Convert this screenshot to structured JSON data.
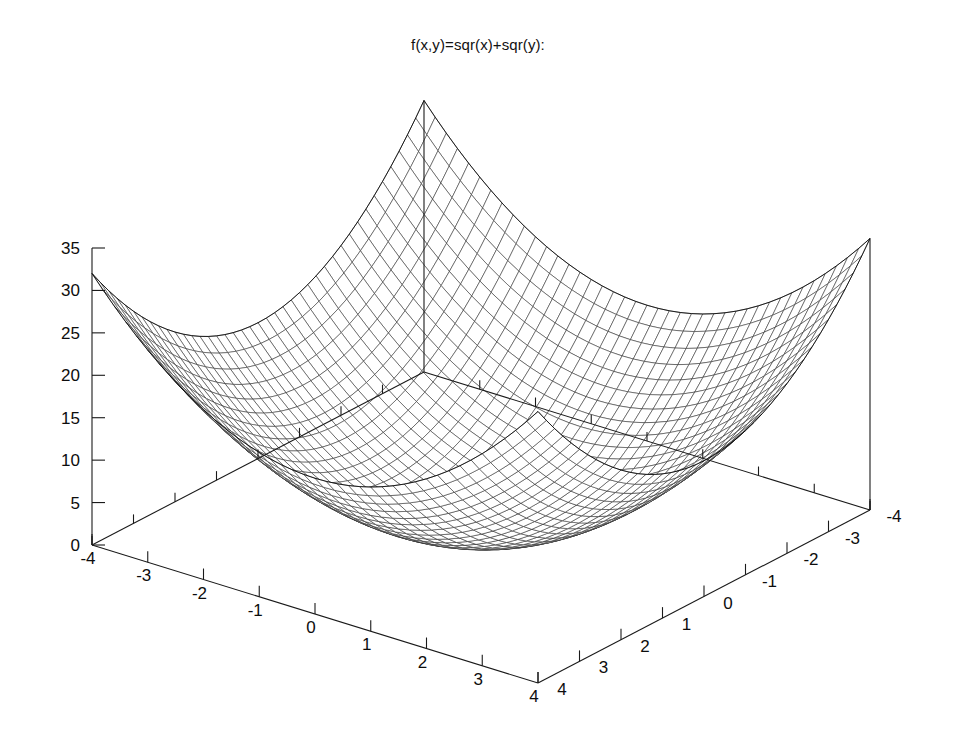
{
  "plot": {
    "title": "f(x,y)=sqr(x)+sqr(y):",
    "background_color": "#ffffff",
    "line_color": "#2b2b2b",
    "axis_color": "#1a1a1a",
    "style": "wireframe-mesh"
  },
  "chart_data": {
    "type": "surface",
    "title": "f(x,y)=sqr(x)+sqr(y):",
    "function": "z = x^2 + y^2",
    "xlabel": "",
    "ylabel": "",
    "zlabel": "",
    "xlim": [
      -4,
      4
    ],
    "ylim": [
      -4,
      4
    ],
    "zlim": [
      0,
      35
    ],
    "x_ticks": [
      "-4",
      "-3",
      "-2",
      "-1",
      "0",
      "1",
      "2",
      "3",
      "4"
    ],
    "x_tick_values": [
      -4,
      -3,
      -2,
      -1,
      0,
      1,
      2,
      3,
      4
    ],
    "y_ticks": [
      "-4",
      "-3",
      "-2",
      "-1",
      "0",
      "1",
      "2",
      "3",
      "4"
    ],
    "y_tick_values": [
      -4,
      -3,
      -2,
      -1,
      0,
      1,
      2,
      3,
      4
    ],
    "z_ticks": [
      "0",
      "5",
      "10",
      "15",
      "20",
      "25",
      "30",
      "35"
    ],
    "z_tick_values": [
      0,
      5,
      10,
      15,
      20,
      25,
      30,
      35
    ],
    "grid": false,
    "legend": false,
    "mesh_samples": 41,
    "hidden_line_removal": true,
    "corner_values": [
      {
        "x": -4,
        "y": -4,
        "z": 32
      },
      {
        "x": 4,
        "y": -4,
        "z": 32
      },
      {
        "x": -4,
        "y": 4,
        "z": 32
      },
      {
        "x": 4,
        "y": 4,
        "z": 32
      },
      {
        "x": 0,
        "y": 0,
        "z": 0
      }
    ],
    "sample_points": [
      {
        "x": -4,
        "y": 0,
        "z": 16
      },
      {
        "x": 0,
        "y": -4,
        "z": 16
      },
      {
        "x": 4,
        "y": 0,
        "z": 16
      },
      {
        "x": 0,
        "y": 4,
        "z": 16
      },
      {
        "x": -2,
        "y": -2,
        "z": 8
      },
      {
        "x": 2,
        "y": 2,
        "z": 8
      },
      {
        "x": -2,
        "y": 2,
        "z": 8
      },
      {
        "x": 2,
        "y": -2,
        "z": 8
      },
      {
        "x": -1,
        "y": -1,
        "z": 2
      },
      {
        "x": 1,
        "y": 1,
        "z": 2
      }
    ]
  },
  "view": {
    "rot_x_deg": 60,
    "rot_z_deg": 30,
    "projection": "parallel"
  }
}
